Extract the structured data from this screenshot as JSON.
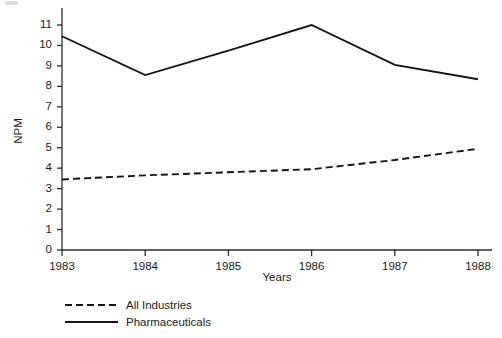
{
  "chart_data": {
    "type": "line",
    "title": "",
    "xlabel": "Years",
    "ylabel": "NPM",
    "categories": [
      "1983",
      "1984",
      "1985",
      "1986",
      "1987",
      "1988"
    ],
    "x": [
      1983,
      1984,
      1985,
      1986,
      1987,
      1988
    ],
    "xlim": [
      1983,
      1988
    ],
    "ylim": [
      0,
      11
    ],
    "yticks": [
      0,
      1,
      2,
      3,
      4,
      5,
      6,
      7,
      8,
      9,
      10,
      11
    ],
    "ytick_labels": [
      "0",
      "1",
      "2",
      "3",
      "4",
      "5",
      "6",
      "7",
      "8",
      "9",
      "10",
      "11"
    ],
    "xticks": [
      1983,
      1984,
      1985,
      1986,
      1987,
      1988
    ],
    "xtick_labels": [
      "1983",
      "1984",
      "1985",
      "1986",
      "1987",
      "1988"
    ],
    "grid": false,
    "legend_position": "below-left",
    "series": [
      {
        "name": "All Industries",
        "style": "dashed",
        "color": "#141414",
        "values": [
          3.45,
          3.65,
          3.8,
          3.95,
          4.4,
          4.95
        ]
      },
      {
        "name": "Pharmaceuticals",
        "style": "solid",
        "color": "#141414",
        "values": [
          10.45,
          8.55,
          9.75,
          11.0,
          9.05,
          8.35
        ]
      }
    ]
  },
  "axes": {
    "y_axis_title": "NPM",
    "x_axis_title": "Years"
  },
  "legend": {
    "entries": [
      {
        "label": "All Industries",
        "style": "dashed"
      },
      {
        "label": "Pharmaceuticals",
        "style": "solid"
      }
    ]
  }
}
